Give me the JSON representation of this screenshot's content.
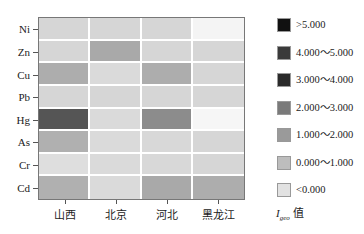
{
  "chart_data": {
    "type": "heatmap",
    "title": "",
    "xlabel": "",
    "ylabel": "",
    "x_categories": [
      "山西",
      "北京",
      "河北",
      "黑龙江"
    ],
    "y_categories": [
      "Ni",
      "Zn",
      "Cu",
      "Pb",
      "Hg",
      "As",
      "Cr",
      "Cd"
    ],
    "values_class": [
      [
        "0.000~1.000",
        "0.000~1.000",
        "0.000~1.000",
        "<0.000"
      ],
      [
        "0.000~1.000",
        "1.000~2.000",
        "0.000~1.000",
        "0.000~1.000"
      ],
      [
        "1.000~2.000",
        "0.000~1.000",
        "1.000~2.000",
        "0.000~1.000"
      ],
      [
        "0.000~1.000",
        "0.000~1.000",
        "0.000~1.000",
        "0.000~1.000"
      ],
      [
        "4.000~5.000",
        "0.000~1.000",
        "2.000~3.000",
        "<0.000"
      ],
      [
        "1.000~2.000",
        "0.000~1.000",
        "0.000~1.000",
        "0.000~1.000"
      ],
      [
        "0.000~1.000",
        "0.000~1.000",
        "0.000~1.000",
        "0.000~1.000"
      ],
      [
        "1.000~2.000",
        "0.000~1.000",
        "1.000~2.000",
        "1.000~2.000"
      ]
    ],
    "colors": [
      [
        "#d6d6d6",
        "#d6d6d6",
        "#d6d6d6",
        "#f4f4f4"
      ],
      [
        "#d6d6d6",
        "#a9a9a9",
        "#d6d6d6",
        "#d6d6d6"
      ],
      [
        "#adadad",
        "#dadada",
        "#adadad",
        "#d6d6d6"
      ],
      [
        "#d6d6d6",
        "#d6d6d6",
        "#d6d6d6",
        "#d6d6d6"
      ],
      [
        "#555555",
        "#dadada",
        "#8c8c8c",
        "#f6f6f6"
      ],
      [
        "#b0b0b0",
        "#dadada",
        "#d8d8d8",
        "#d6d6d6"
      ],
      [
        "#dedede",
        "#dadada",
        "#d8d8d8",
        "#d6d6d6"
      ],
      [
        "#b0b0b0",
        "#dadada",
        "#a9a9a9",
        "#adadad"
      ]
    ],
    "legend": {
      "title": "Igeo 值",
      "position": "right",
      "entries": [
        {
          "label": ">5.000",
          "color": "#111111"
        },
        {
          "label": "4.000~5.000",
          "color": "#3a3a3a"
        },
        {
          "label": "3.000~4.000",
          "color": "#2a2a2a"
        },
        {
          "label": "2.000~3.000",
          "color": "#7a7a7a"
        },
        {
          "label": "1.000~2.000",
          "color": "#9a9a9a"
        },
        {
          "label": "0.000~1.000",
          "color": "#bdbdbd"
        },
        {
          "label": "<0.000",
          "color": "#e2e2e2"
        }
      ]
    },
    "grid": false
  },
  "legend_display": {
    "e0": ">5.000",
    "e1": "4.000～5.000",
    "e2": "3.000～4.000",
    "e3": "2.000～3.000",
    "e4": "1.000～2.000",
    "e5": "0.000～1.000",
    "e6": "<0.000",
    "title_main": "I",
    "title_sub": "geo",
    "title_suffix": " 值"
  }
}
